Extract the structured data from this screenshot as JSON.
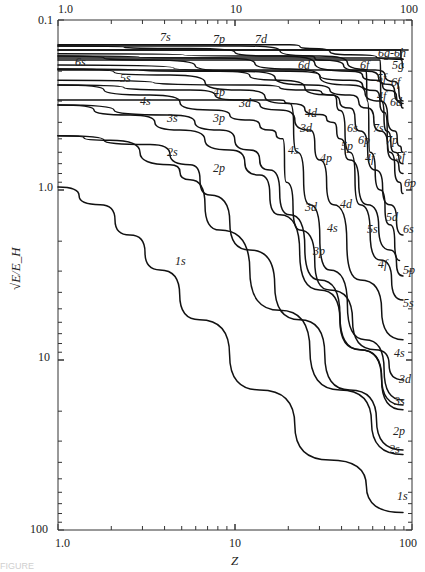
{
  "chart_data": {
    "type": "line",
    "title": "",
    "xlabel": "Z",
    "ylabel": "√E/E_H",
    "xscale": "log",
    "yscale": "log",
    "xlim": [
      1,
      100
    ],
    "ylim": [
      0.1,
      100
    ],
    "y_inverted": true,
    "x_ticks_bottom": [
      "1.0",
      "10",
      "100"
    ],
    "x_ticks_top": [
      "1.0",
      "10",
      "100"
    ],
    "y_ticks": [
      "0.1",
      "1.0",
      "10",
      "100"
    ],
    "grid": false,
    "legend": "inline curve labels",
    "series": [
      {
        "name": "1s",
        "points": [
          [
            1,
            0.96
          ],
          [
            1.73,
            1.22
          ],
          [
            2.55,
            1.84
          ],
          [
            3.77,
            2.95
          ],
          [
            6.3,
            5.8
          ],
          [
            13.8,
            15
          ],
          [
            34.3,
            38.7
          ],
          [
            89,
            79
          ]
        ]
      },
      {
        "name": "2s",
        "points": [
          [
            1,
            0.48
          ],
          [
            1.97,
            0.51
          ],
          [
            4.29,
            0.71
          ],
          [
            5.57,
            0.87
          ],
          [
            8.22,
            1.72
          ],
          [
            17.9,
            5.1
          ],
          [
            39.2,
            15
          ],
          [
            89,
            36
          ]
        ]
      },
      {
        "name": "2p",
        "points": [
          [
            1,
            0.48
          ],
          [
            3.31,
            0.54
          ],
          [
            5.57,
            0.71
          ],
          [
            7.22,
            1.07
          ],
          [
            12.1,
            2.25
          ],
          [
            23.2,
            5.8
          ],
          [
            44.6,
            15
          ],
          [
            89,
            33.8
          ]
        ]
      },
      {
        "name": "3s",
        "points": [
          [
            1,
            0.316
          ],
          [
            2.55,
            0.362
          ],
          [
            4.88,
            0.444
          ],
          [
            9.36,
            0.582
          ],
          [
            13.8,
            0.816
          ],
          [
            17.9,
            1.4
          ],
          [
            30.1,
            3.87
          ],
          [
            50.9,
            8.7
          ],
          [
            89,
            19.6
          ]
        ]
      },
      {
        "name": "3p",
        "points": [
          [
            1,
            0.316
          ],
          [
            4.29,
            0.362
          ],
          [
            8.22,
            0.444
          ],
          [
            12.1,
            0.582
          ],
          [
            15.7,
            0.763
          ],
          [
            20.4,
            1.4
          ],
          [
            30.1,
            3.38
          ],
          [
            50.9,
            8.7
          ],
          [
            89,
            18.4
          ]
        ]
      },
      {
        "name": "3d",
        "points": [
          [
            1,
            0.296
          ],
          [
            10.7,
            0.296
          ],
          [
            17.9,
            0.296
          ],
          [
            20.4,
            0.31
          ],
          [
            22.5,
            0.6
          ],
          [
            26.5,
            1.22
          ],
          [
            34.3,
            2.95
          ],
          [
            54.3,
            7.6
          ],
          [
            89,
            17.2
          ]
        ]
      },
      {
        "name": "4s",
        "points": [
          [
            1,
            0.241
          ],
          [
            3.31,
            0.276
          ],
          [
            7.22,
            0.338
          ],
          [
            12.1,
            0.388
          ],
          [
            15.7,
            0.444
          ],
          [
            18.6,
            0.5
          ],
          [
            19.5,
            0.9
          ],
          [
            23.2,
            1.72
          ],
          [
            34.3,
            3.87
          ],
          [
            62,
            8.7
          ],
          [
            89,
            13.1
          ]
        ]
      },
      {
        "name": "4p",
        "points": [
          [
            1,
            0.241
          ],
          [
            5.57,
            0.258
          ],
          [
            10.7,
            0.296
          ],
          [
            17.9,
            0.338
          ],
          [
            26.5,
            0.444
          ],
          [
            30.1,
            0.666
          ],
          [
            36,
            1.22
          ],
          [
            50.9,
            3.38
          ],
          [
            89,
            7.6
          ]
        ]
      },
      {
        "name": "4d",
        "points": [
          [
            1,
            0.226
          ],
          [
            12.1,
            0.241
          ],
          [
            26.5,
            0.258
          ],
          [
            36,
            0.276
          ],
          [
            39.2,
            0.34
          ],
          [
            44.6,
            0.6
          ],
          [
            50.9,
            1.22
          ],
          [
            66.1,
            2.58
          ],
          [
            89,
            4.44
          ]
        ]
      },
      {
        "name": "4f",
        "points": [
          [
            1,
            0.197
          ],
          [
            50.9,
            0.197
          ],
          [
            55,
            0.197
          ],
          [
            56,
            0.3
          ],
          [
            58,
            0.6
          ],
          [
            66.1,
            1.0
          ],
          [
            75,
            1.6
          ],
          [
            85,
            2.6
          ]
        ]
      },
      {
        "name": "5s",
        "points": [
          [
            1,
            0.194
          ],
          [
            4.29,
            0.211
          ],
          [
            10.7,
            0.258
          ],
          [
            20.4,
            0.31
          ],
          [
            30.1,
            0.36
          ],
          [
            36,
            0.4
          ],
          [
            39.2,
            0.5
          ],
          [
            44.6,
            0.666
          ],
          [
            56,
            1.22
          ],
          [
            75,
            2.25
          ],
          [
            89,
            3.2
          ]
        ]
      },
      {
        "name": "5p",
        "points": [
          [
            1,
            0.194
          ],
          [
            8.22,
            0.2
          ],
          [
            17.9,
            0.226
          ],
          [
            34.3,
            0.276
          ],
          [
            44.6,
            0.33
          ],
          [
            50.9,
            0.45
          ],
          [
            62,
            0.763
          ],
          [
            75,
            1.22
          ],
          [
            89,
            1.84
          ]
        ]
      },
      {
        "name": "5d",
        "points": [
          [
            1,
            0.184
          ],
          [
            20.4,
            0.2
          ],
          [
            44.6,
            0.226
          ],
          [
            62,
            0.26
          ],
          [
            70,
            0.35
          ],
          [
            75,
            0.6
          ],
          [
            85,
            0.9
          ],
          [
            89,
            1.05
          ]
        ]
      },
      {
        "name": "5f",
        "points": [
          [
            1,
            0.172
          ],
          [
            62,
            0.172
          ],
          [
            66,
            0.172
          ],
          [
            67,
            0.3
          ],
          [
            72,
            0.45
          ],
          [
            80,
            0.6
          ],
          [
            89,
            0.7
          ]
        ]
      },
      {
        "name": "5g",
        "points": [
          [
            1,
            0.167
          ],
          [
            85,
            0.167
          ],
          [
            89,
            0.17
          ]
        ]
      },
      {
        "name": "6s",
        "points": [
          [
            1,
            0.163
          ],
          [
            3.31,
            0.172
          ],
          [
            10.7,
            0.2
          ],
          [
            26.5,
            0.241
          ],
          [
            44.6,
            0.276
          ],
          [
            56,
            0.33
          ],
          [
            66.1,
            0.45
          ],
          [
            80,
            0.666
          ],
          [
            89,
            0.8
          ]
        ]
      },
      {
        "name": "6p",
        "points": [
          [
            1,
            0.163
          ],
          [
            8.22,
            0.167
          ],
          [
            20.4,
            0.194
          ],
          [
            44.6,
            0.241
          ],
          [
            66.1,
            0.3
          ],
          [
            80,
            0.45
          ],
          [
            85,
            0.55
          ],
          [
            89,
            0.6
          ]
        ]
      },
      {
        "name": "6d",
        "points": [
          [
            1,
            0.158
          ],
          [
            26.5,
            0.163
          ],
          [
            30.1,
            0.172
          ],
          [
            56,
            0.2
          ],
          [
            75,
            0.24
          ],
          [
            85,
            0.3
          ],
          [
            89,
            0.33
          ]
        ]
      },
      {
        "name": "6f",
        "points": [
          [
            1,
            0.15
          ],
          [
            70,
            0.15
          ],
          [
            86,
            0.15
          ],
          [
            87,
            0.172
          ],
          [
            89,
            0.19
          ]
        ]
      },
      {
        "name": "6g-6h",
        "points": [
          [
            1,
            0.15
          ],
          [
            95,
            0.15
          ]
        ]
      },
      {
        "name": "7s",
        "points": [
          [
            1,
            0.142
          ],
          [
            5.57,
            0.147
          ],
          [
            17.9,
            0.163
          ],
          [
            44.6,
            0.2
          ],
          [
            62,
            0.226
          ],
          [
            75,
            0.26
          ],
          [
            89,
            0.31
          ]
        ]
      },
      {
        "name": "7p",
        "points": [
          [
            1,
            0.142
          ],
          [
            10.7,
            0.142
          ],
          [
            30.1,
            0.163
          ],
          [
            62,
            0.197
          ],
          [
            80,
            0.23
          ],
          [
            89,
            0.3
          ]
        ]
      },
      {
        "name": "7d",
        "points": [
          [
            1,
            0.14
          ],
          [
            10.7,
            0.14
          ],
          [
            20.4,
            0.14
          ],
          [
            26.5,
            0.147
          ],
          [
            44.6,
            0.16
          ],
          [
            89,
            0.17
          ]
        ]
      }
    ]
  },
  "axes": {
    "top_ticks": [
      "1.0",
      "10",
      "100"
    ],
    "bottom_ticks": [
      "1.0",
      "10",
      "100"
    ],
    "left_ticks": [
      "0.1",
      "1.0",
      "10",
      "100"
    ],
    "xlabel": "Z",
    "ylabel": "√E/E_H"
  },
  "labels": [
    {
      "text": "7s",
      "x": 160,
      "y": 41
    },
    {
      "text": "7p",
      "x": 213,
      "y": 43
    },
    {
      "text": "7d",
      "x": 255,
      "y": 43
    },
    {
      "text": "6g-6h",
      "x": 378,
      "y": 57
    },
    {
      "text": "6s",
      "x": 75,
      "y": 66
    },
    {
      "text": "6d",
      "x": 298,
      "y": 69
    },
    {
      "text": "6f",
      "x": 360,
      "y": 69
    },
    {
      "text": "5g",
      "x": 392,
      "y": 69
    },
    {
      "text": "5s",
      "x": 120,
      "y": 82
    },
    {
      "text": "5f",
      "x": 377,
      "y": 82
    },
    {
      "text": "6f",
      "x": 391,
      "y": 86
    },
    {
      "text": "4s",
      "x": 140,
      "y": 105
    },
    {
      "text": "4p",
      "x": 213,
      "y": 96
    },
    {
      "text": "3d",
      "x": 239,
      "y": 107
    },
    {
      "text": "4f",
      "x": 377,
      "y": 100
    },
    {
      "text": "6d",
      "x": 390,
      "y": 106
    },
    {
      "text": "3s",
      "x": 167,
      "y": 122
    },
    {
      "text": "3p",
      "x": 213,
      "y": 122
    },
    {
      "text": "4d",
      "x": 305,
      "y": 117
    },
    {
      "text": "6s",
      "x": 347,
      "y": 132
    },
    {
      "text": "7s",
      "x": 373,
      "y": 132
    },
    {
      "text": "3d",
      "x": 300,
      "y": 132
    },
    {
      "text": "6p",
      "x": 358,
      "y": 144
    },
    {
      "text": "7p",
      "x": 386,
      "y": 144
    },
    {
      "text": "5p",
      "x": 341,
      "y": 150
    },
    {
      "text": "4s",
      "x": 288,
      "y": 154
    },
    {
      "text": "4f",
      "x": 365,
      "y": 162
    },
    {
      "text": "4p",
      "x": 320,
      "y": 162
    },
    {
      "text": "5f",
      "x": 396,
      "y": 160
    },
    {
      "text": "6p",
      "x": 404,
      "y": 187
    },
    {
      "text": "2s",
      "x": 167,
      "y": 156
    },
    {
      "text": "2p",
      "x": 213,
      "y": 172
    },
    {
      "text": "4d",
      "x": 340,
      "y": 208
    },
    {
      "text": "3d",
      "x": 305,
      "y": 211
    },
    {
      "text": "5d",
      "x": 386,
      "y": 221
    },
    {
      "text": "4s",
      "x": 327,
      "y": 232
    },
    {
      "text": "5s",
      "x": 367,
      "y": 233
    },
    {
      "text": "6s",
      "x": 403,
      "y": 233
    },
    {
      "text": "1s",
      "x": 175,
      "y": 265
    },
    {
      "text": "3p",
      "x": 313,
      "y": 255
    },
    {
      "text": "4f",
      "x": 378,
      "y": 268
    },
    {
      "text": "5p",
      "x": 403,
      "y": 274
    },
    {
      "text": "5s",
      "x": 403,
      "y": 307
    },
    {
      "text": "4s",
      "x": 394,
      "y": 357
    },
    {
      "text": "3d",
      "x": 399,
      "y": 383
    },
    {
      "text": "3s",
      "x": 394,
      "y": 405
    },
    {
      "text": "2p",
      "x": 393,
      "y": 435
    },
    {
      "text": "2s",
      "x": 389,
      "y": 453
    },
    {
      "text": "1s",
      "x": 397,
      "y": 500
    }
  ],
  "caption": "FIGURE"
}
